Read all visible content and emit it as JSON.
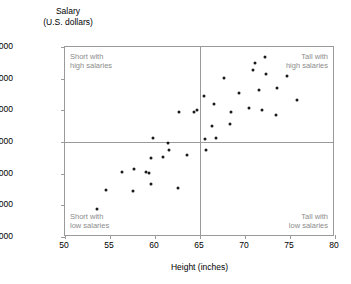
{
  "chart_data": {
    "type": "scatter",
    "title": "",
    "xlabel": "Height (inches)",
    "ylabel_line1": "Salary",
    "ylabel_line2": "(U.S. dollars)",
    "xlim": [
      50,
      80
    ],
    "ylim": [
      20000,
      50000
    ],
    "xticks": [
      50,
      55,
      60,
      65,
      70,
      75,
      80
    ],
    "xtick_labels": [
      "50",
      "55",
      "60",
      "65",
      "70",
      "75",
      "80"
    ],
    "yticks": [
      20000,
      25000,
      30000,
      35000,
      40000,
      45000,
      50000
    ],
    "ytick_labels": [
      "20,000",
      "25,000",
      "30,000",
      "35,000",
      "40,000",
      "45,000",
      "50,000"
    ],
    "grid": false,
    "reference_lines": {
      "vertical_x": 65,
      "horizontal_y": 35000,
      "color": "#9a9a9a"
    },
    "annotations": [
      {
        "id": "top-left",
        "line1": "Short with",
        "line2": "high salaries",
        "color": "#8c8c8c"
      },
      {
        "id": "top-right",
        "line1": "Tall with",
        "line2": "high salaries",
        "color": "#8c8c8c"
      },
      {
        "id": "bottom-left",
        "line1": "Short with",
        "line2": "low salaries",
        "color": "#8c8c8c"
      },
      {
        "id": "bottom-right",
        "line1": "Tall with",
        "line2": "low salaries",
        "color": "#8c8c8c"
      }
    ],
    "marker_color": "#1a1a1a",
    "points": [
      [
        53.5,
        24500
      ],
      [
        54.5,
        27500
      ],
      [
        56.3,
        30300
      ],
      [
        57.6,
        27300
      ],
      [
        57.7,
        30700
      ],
      [
        59.0,
        30200
      ],
      [
        59.3,
        30100
      ],
      [
        59.6,
        28400
      ],
      [
        59.6,
        32400
      ],
      [
        59.8,
        35700
      ],
      [
        60.9,
        32600
      ],
      [
        61.4,
        34900
      ],
      [
        61.6,
        33800
      ],
      [
        62.6,
        27800
      ],
      [
        62.7,
        39700
      ],
      [
        63.5,
        32900
      ],
      [
        64.3,
        39800
      ],
      [
        64.7,
        40100
      ],
      [
        65.4,
        42200
      ],
      [
        65.6,
        35500
      ],
      [
        65.7,
        33700
      ],
      [
        66.3,
        37500
      ],
      [
        66.6,
        41000
      ],
      [
        66.8,
        35600
      ],
      [
        67.7,
        45100
      ],
      [
        68.3,
        37800
      ],
      [
        68.4,
        39700
      ],
      [
        69.3,
        42700
      ],
      [
        70.4,
        40400
      ],
      [
        70.9,
        46300
      ],
      [
        71.1,
        47500
      ],
      [
        71.6,
        43200
      ],
      [
        71.9,
        40000
      ],
      [
        72.2,
        48400
      ],
      [
        72.3,
        45700
      ],
      [
        73.4,
        39300
      ],
      [
        73.5,
        43500
      ],
      [
        74.7,
        45400
      ],
      [
        75.8,
        41600
      ]
    ]
  }
}
